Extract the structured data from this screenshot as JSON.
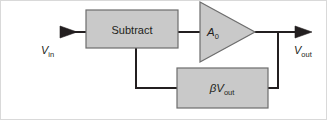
{
  "figure": {
    "type": "block-diagram",
    "background_color": "#ffffff",
    "frame_color": "#d9d9d9"
  },
  "style": {
    "block_fill": "#c9c9c9",
    "block_stroke": "#6d6d6d",
    "line_color": "#231f20",
    "text_color": "#231f20"
  },
  "blocks": {
    "subtract": {
      "label": "Subtract",
      "shape": "rectangle"
    },
    "amplifier": {
      "label": "A",
      "label_sub": "0",
      "shape": "triangle"
    },
    "feedback": {
      "label_beta": "β",
      "label_v": "V",
      "label_sub": "out",
      "shape": "rectangle"
    }
  },
  "terminals": {
    "input": {
      "label_v": "V",
      "label_sub": "in",
      "arrow": "arrowhead-right-icon"
    },
    "output": {
      "label_v": "V",
      "label_sub": "out",
      "arrow": "arrowhead-right-icon"
    }
  },
  "connections": [
    {
      "name": "input-to-subtract",
      "from": "input",
      "to": "subtract"
    },
    {
      "name": "subtract-to-amplifier",
      "from": "subtract",
      "to": "amplifier"
    },
    {
      "name": "amplifier-to-output",
      "from": "amplifier",
      "to": "output"
    },
    {
      "name": "output-tap-to-feedback",
      "from": "output",
      "to": "feedback"
    },
    {
      "name": "feedback-to-subtract",
      "from": "feedback",
      "to": "subtract"
    }
  ]
}
